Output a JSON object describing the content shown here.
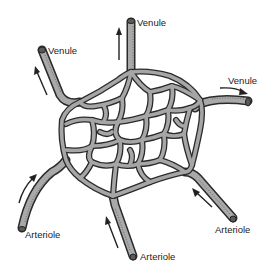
{
  "diagram": {
    "labels": {
      "venule_top": "Venule",
      "venule_left": "Venule",
      "venule_right": "Venule",
      "arteriole_left": "Arteriole",
      "arteriole_bottom": "Arteriole",
      "arteriole_right": "Arteriole"
    },
    "flow_direction": {
      "arterioles": "into network",
      "venules": "out of network"
    },
    "colors": {
      "vessel_fill": "#a9a9a9",
      "vessel_outline": "#2b2b2b",
      "arrow": "#222222",
      "background": "#ffffff"
    }
  }
}
